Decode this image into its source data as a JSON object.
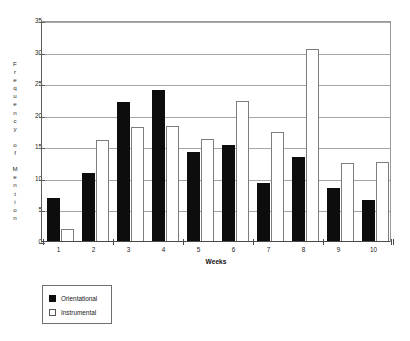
{
  "chart_data": {
    "type": "bar",
    "title": "",
    "subtitle": "",
    "xlabel": "Weeks",
    "ylabel": "Frequency of Mention",
    "categories": [
      "1",
      "2",
      "3",
      "4",
      "5",
      "6",
      "7",
      "8",
      "9",
      "10"
    ],
    "series": [
      {
        "name": "Orientational",
        "color": "#0d0d0d",
        "values": [
          7.0,
          11.0,
          22.1,
          24.1,
          14.3,
          15.3,
          9.4,
          13.5,
          8.6,
          6.6
        ]
      },
      {
        "name": "Instrumental",
        "color": "#ffffff",
        "values": [
          2.0,
          16.1,
          18.2,
          18.3,
          16.3,
          22.3,
          17.4,
          30.6,
          12.5,
          12.6
        ]
      }
    ],
    "ylim": [
      0,
      35
    ],
    "yticks": [
      0,
      5,
      10,
      15,
      20,
      25,
      30,
      35
    ],
    "ytick_labels": [
      "0",
      "5",
      "10",
      "15",
      "20",
      "25",
      "30",
      "35"
    ],
    "grid": true,
    "grid_axis": "y",
    "legend_position": "bottom-left",
    "legend_entries": [
      "Orientational",
      "Instrumental"
    ]
  },
  "axis": {
    "y_title_stacked": "F\nr\ne\nq\nu\ne\nn\nc\ny\n\no\nf\n\nM\ne\nn\nt\ni\no\nn",
    "x_title": "Weeks"
  },
  "legend": {
    "items": [
      {
        "label": "Orientational",
        "swatch": "filled-black-square"
      },
      {
        "label": "Instrumental",
        "swatch": "outlined-white-square"
      }
    ]
  }
}
